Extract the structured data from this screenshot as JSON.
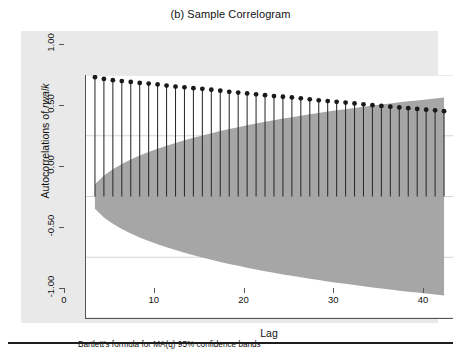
{
  "figure": {
    "title": "(b) Sample Correlogram",
    "note": "Bartlett's formula for MA(q) 95% confidence bands"
  },
  "axes": {
    "ylabel_prefix": "Autocorrelations of ",
    "ylabel_variable": "rwalk",
    "xlabel": "Lag",
    "ytick_labels": [
      "1.00",
      "0.50",
      "0.00",
      "-0.50",
      "-1.00"
    ],
    "xtick_labels": [
      "0",
      "10",
      "20",
      "30",
      "40"
    ]
  },
  "colors": {
    "graph_region": "#e9e9e9",
    "plot_region": "#ffffff",
    "band_fill": "#a6a6a6",
    "stem_line": "#2b2b2b",
    "marker": "#1a1a1a",
    "axis": "#555555",
    "gridline": "#cfcfcf",
    "rule": "#1d1d1d"
  },
  "chart_data": {
    "type": "bar",
    "title": "(b) Sample Correlogram",
    "subtitle": "",
    "xlabel": "Lag",
    "ylabel": "Autocorrelations of rwalk",
    "xlim": [
      0,
      41
    ],
    "ylim": [
      -1.0,
      1.0
    ],
    "yticks": [
      1.0,
      0.5,
      0.0,
      -0.5,
      -1.0
    ],
    "xticks": [
      0,
      10,
      20,
      30,
      40
    ],
    "grid": true,
    "grid_axis": "y",
    "legend": "none",
    "annotation": "Bartlett's formula for MA(q) 95% confidence bands",
    "series_style": "stem-with-round-markers",
    "categories": [
      1,
      2,
      3,
      4,
      5,
      6,
      7,
      8,
      9,
      10,
      11,
      12,
      13,
      14,
      15,
      16,
      17,
      18,
      19,
      20,
      21,
      22,
      23,
      24,
      25,
      26,
      27,
      28,
      29,
      30,
      31,
      32,
      33,
      34,
      35,
      36,
      37,
      38,
      39,
      40
    ],
    "values": [
      0.982,
      0.968,
      0.957,
      0.95,
      0.943,
      0.935,
      0.929,
      0.922,
      0.913,
      0.905,
      0.899,
      0.892,
      0.886,
      0.879,
      0.871,
      0.862,
      0.855,
      0.848,
      0.841,
      0.834,
      0.827,
      0.821,
      0.815,
      0.808,
      0.8,
      0.792,
      0.785,
      0.779,
      0.773,
      0.766,
      0.759,
      0.752,
      0.745,
      0.739,
      0.733,
      0.727,
      0.721,
      0.715,
      0.709,
      0.702
    ],
    "confidence_band": {
      "name": "Bartlett 95% confidence band",
      "type": "area",
      "fill": "#a6a6a6",
      "x": [
        1,
        2,
        3,
        4,
        5,
        6,
        7,
        8,
        9,
        10,
        11,
        12,
        13,
        14,
        15,
        16,
        17,
        18,
        19,
        20,
        21,
        22,
        23,
        24,
        25,
        26,
        27,
        28,
        29,
        30,
        31,
        32,
        33,
        34,
        35,
        36,
        37,
        38,
        39,
        40
      ],
      "upper": [
        0.1,
        0.172,
        0.224,
        0.267,
        0.304,
        0.337,
        0.366,
        0.393,
        0.418,
        0.441,
        0.463,
        0.484,
        0.503,
        0.521,
        0.539,
        0.555,
        0.571,
        0.586,
        0.601,
        0.615,
        0.628,
        0.641,
        0.653,
        0.665,
        0.677,
        0.688,
        0.699,
        0.709,
        0.719,
        0.729,
        0.739,
        0.748,
        0.757,
        0.766,
        0.775,
        0.783,
        0.791,
        0.799,
        0.807,
        0.815
      ],
      "lower": [
        -0.1,
        -0.172,
        -0.224,
        -0.267,
        -0.304,
        -0.337,
        -0.366,
        -0.393,
        -0.418,
        -0.441,
        -0.463,
        -0.484,
        -0.503,
        -0.521,
        -0.539,
        -0.555,
        -0.571,
        -0.586,
        -0.601,
        -0.615,
        -0.628,
        -0.641,
        -0.653,
        -0.665,
        -0.677,
        -0.688,
        -0.699,
        -0.709,
        -0.719,
        -0.729,
        -0.739,
        -0.748,
        -0.757,
        -0.766,
        -0.775,
        -0.783,
        -0.791,
        -0.799,
        -0.807,
        -0.815
      ]
    }
  }
}
